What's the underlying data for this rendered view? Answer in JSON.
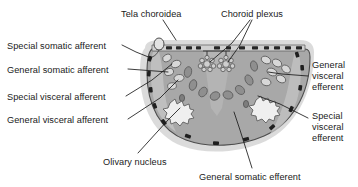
{
  "figure": {
    "background_color": "#ffffff",
    "label_color": "#1a1a1a",
    "leader_line_color": "#1a1a1a"
  },
  "palette": {
    "outer_halo": "#d9d9d9",
    "body_fill": "#a8a8a8",
    "body_stroke": "#4d4d4d",
    "inner_light": "#c4c4c4",
    "nucleus_fill": "#8f8f8f",
    "nucleus_stroke": "#5a5a5a",
    "nucleus_light_fill": "#d8d8d8",
    "dash_mark": "#262626",
    "tela_fill": "#d0d0d0",
    "plexus_fill": "#cfcfcf",
    "olivary_fill": "#efefef"
  },
  "labels": {
    "tela_choroidea": "Tela choroidea",
    "choroid_plexus": "Choroid plexus",
    "special_somatic_afferent": "Special somatic afferent",
    "general_somatic_afferent": "General somatic afferent",
    "special_visceral_afferent": "Special visceral afferent",
    "general_visceral_afferent": "General visceral afferent",
    "general_visceral_efferent": "General visceral efferent",
    "special_visceral_efferent": "Special visceral efferent",
    "olivary_nucleus": "Olivary nucleus",
    "general_somatic_efferent": "General somatic efferent"
  },
  "label_positions": {
    "tela_choroidea": {
      "x": 121,
      "y": 9
    },
    "choroid_plexus": {
      "x": 221,
      "y": 9
    },
    "special_somatic_afferent": {
      "x": 7,
      "y": 41
    },
    "general_somatic_afferent": {
      "x": 7,
      "y": 65
    },
    "special_visceral_afferent": {
      "x": 7,
      "y": 92
    },
    "general_visceral_afferent": {
      "x": 7,
      "y": 115
    },
    "general_visceral_efferent": {
      "x": 312,
      "y": 60
    },
    "special_visceral_efferent": {
      "x": 312,
      "y": 111
    },
    "olivary_nucleus": {
      "x": 103,
      "y": 157
    },
    "general_somatic_efferent": {
      "x": 199,
      "y": 172
    }
  },
  "diagram": {
    "structure_names": [
      "outer-halo",
      "medulla-body",
      "tela-choroidea-membrane",
      "choroid-plexus-tuft-left",
      "choroid-plexus-tuft-right",
      "olivary-nucleus-left",
      "olivary-nucleus-right",
      "nucleus-column-left",
      "nucleus-column-right",
      "midline-nucleus-column"
    ]
  }
}
